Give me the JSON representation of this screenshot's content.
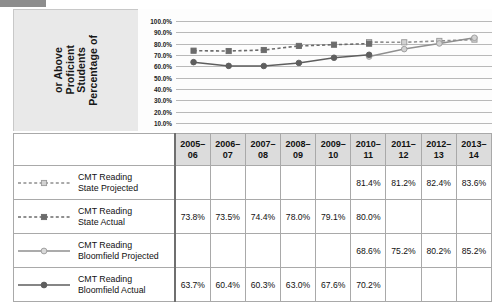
{
  "chart_data": {
    "type": "line",
    "title": "",
    "xlabel": "",
    "ylabel": "Percentage of Students Proficient or Above",
    "ylim": [
      10,
      100
    ],
    "ytick_labels": [
      "100.0%",
      "90.0%",
      "80.0%",
      "70.0%",
      "60.0%",
      "50.0%",
      "40.0%",
      "30.0%",
      "20.0%",
      "10.0%"
    ],
    "ytick_values": [
      100,
      90,
      80,
      70,
      60,
      50,
      40,
      30,
      20,
      10
    ],
    "grid": true,
    "legend_position": "table-left-column",
    "categories": [
      "2005–06",
      "2006–07",
      "2007–08",
      "2008–09",
      "2009–10",
      "2010–11",
      "2011–12",
      "2012–13",
      "2013–14"
    ],
    "series": [
      {
        "name": "CMT Reading State Projected",
        "style": "dashed",
        "marker": "square-light",
        "color": "#8f8f8f",
        "values": [
          null,
          null,
          null,
          null,
          null,
          81.4,
          81.2,
          82.4,
          83.6
        ],
        "display_values": [
          "",
          "",
          "",
          "",
          "",
          "81.4%",
          "81.2%",
          "82.4%",
          "83.6%"
        ]
      },
      {
        "name": "CMT Reading State Actual",
        "style": "dashed",
        "marker": "square-dark",
        "color": "#6b6b6b",
        "values": [
          73.8,
          73.5,
          74.4,
          78.0,
          79.1,
          80.0,
          null,
          null,
          null
        ],
        "display_values": [
          "73.8%",
          "73.5%",
          "74.4%",
          "78.0%",
          "79.1%",
          "80.0%",
          "",
          "",
          ""
        ]
      },
      {
        "name": "CMT Reading Bloomfield Projected",
        "style": "solid",
        "marker": "circle-light",
        "color": "#8f8f8f",
        "values": [
          null,
          null,
          null,
          null,
          null,
          68.6,
          75.2,
          80.2,
          85.2
        ],
        "display_values": [
          "",
          "",
          "",
          "",
          "",
          "68.6%",
          "75.2%",
          "80.2%",
          "85.2%"
        ]
      },
      {
        "name": "CMT Reading Bloomfield Actual",
        "style": "solid",
        "marker": "circle-dark",
        "color": "#5e5e5e",
        "values": [
          63.7,
          60.4,
          60.3,
          63.0,
          67.6,
          70.2,
          null,
          null,
          null
        ],
        "display_values": [
          "63.7%",
          "60.4%",
          "60.3%",
          "63.0%",
          "67.6%",
          "70.2%",
          "",
          "",
          ""
        ]
      }
    ]
  },
  "table": {
    "corner_label": "",
    "headers": [
      "2005–06",
      "2006–07",
      "2007–08",
      "2008–09",
      "2009–10",
      "2010–11",
      "2011–12",
      "2012–13",
      "2013–14"
    ],
    "rows": [
      {
        "label_line1": "CMT Reading",
        "label_line2": "State Projected",
        "marker": "square-light",
        "style": "dashed",
        "cells": [
          "",
          "",
          "",
          "",
          "",
          "81.4%",
          "81.2%",
          "82.4%",
          "83.6%"
        ]
      },
      {
        "label_line1": "CMT Reading",
        "label_line2": "State Actual",
        "marker": "square-dark",
        "style": "dashed",
        "cells": [
          "73.8%",
          "73.5%",
          "74.4%",
          "78.0%",
          "79.1%",
          "80.0%",
          "",
          "",
          ""
        ]
      },
      {
        "label_line1": "CMT Reading",
        "label_line2": "Bloomfield Projected",
        "marker": "circle-light",
        "style": "solid",
        "cells": [
          "",
          "",
          "",
          "",
          "",
          "68.6%",
          "75.2%",
          "80.2%",
          "85.2%"
        ]
      },
      {
        "label_line1": "CMT Reading",
        "label_line2": "Bloomfield Actual",
        "marker": "circle-dark",
        "style": "solid",
        "cells": [
          "63.7%",
          "60.4%",
          "60.3%",
          "63.0%",
          "67.6%",
          "70.2%",
          "",
          "",
          ""
        ]
      }
    ]
  },
  "axis_title_lines": [
    "Percentage of",
    "Students",
    "Proficient",
    "or Above"
  ],
  "colors": {
    "panel_bg": "#e9e9e9",
    "plot_bg": "#fdfdfd",
    "grid": "#b9b9b9",
    "header_bg": "#dcdcdc",
    "border": "#a9a9a9",
    "divider": "#6f6f6f",
    "light_series": "#8f8f8f",
    "dark_series": "#5e5e5e",
    "top_sliver": "#8d8d8d"
  }
}
